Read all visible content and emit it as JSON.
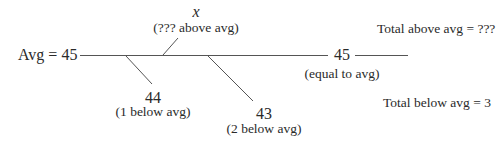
{
  "diagram": {
    "avg_label": "Avg = 45",
    "above_value": "x",
    "above_note": "(??? above avg)",
    "equal_value": "45",
    "equal_note": "(equal to avg)",
    "below1_value": "44",
    "below1_note": "(1 below avg)",
    "below2_value": "43",
    "below2_note": "(2 below avg)",
    "total_above": "Total above avg = ???",
    "total_below": "Total below avg = 3"
  },
  "colors": {
    "line": "#555555",
    "text": "#2a2a2a"
  }
}
